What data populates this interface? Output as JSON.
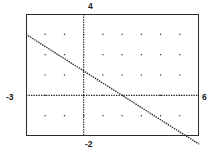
{
  "app": {
    "title": "Coordinate Plane Plot",
    "background_color": "#ffffff",
    "ink_color": "#2a2a2a"
  },
  "plot": {
    "frame": {
      "left": 26,
      "top": 14,
      "width": 173,
      "height": 122
    },
    "axis_style": "dotted",
    "frame_style": "solid-rectangle",
    "grid_style": "dots"
  },
  "labels": {
    "y_max": "4",
    "x_min": "-3",
    "x_max": "6",
    "y_min": "-2"
  },
  "chart_data": {
    "type": "line",
    "title": "",
    "xlabel": "",
    "ylabel": "",
    "xlim": [
      -3,
      6
    ],
    "ylim": [
      -2,
      4
    ],
    "xtick_labels": [
      "-3",
      "6"
    ],
    "ytick_labels": [
      "-2",
      "4"
    ],
    "grid": true,
    "grid_type": "dot-matrix",
    "grid_x_step": 1,
    "grid_y_step": 1,
    "axis_x_at": 0,
    "axis_y_at": 0,
    "legend": null,
    "series": [
      {
        "name": "line",
        "kind": "straight-line",
        "slope": -0.6,
        "intercept": 1.2,
        "equation": "y = -0.6x + 1.2",
        "x_intercept": 2,
        "y_intercept": 1.2,
        "x": [
          -3,
          6
        ],
        "values": [
          3.0,
          -2.4
        ],
        "clipped_endpoints": [
          {
            "x": -3,
            "y": 3.0
          },
          {
            "x": 6,
            "y": -2.4
          }
        ],
        "style": "dotted",
        "color": "#2a2a2a"
      }
    ]
  }
}
